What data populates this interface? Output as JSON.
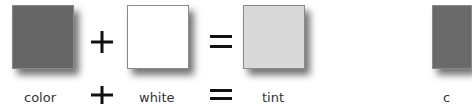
{
  "diagram": {
    "swatches": [
      {
        "id": "color",
        "label": "color",
        "fill": "#666666"
      },
      {
        "id": "white",
        "label": "white",
        "fill": "#ffffff"
      },
      {
        "id": "tint",
        "label": "tint",
        "fill": "#d9d9d9"
      },
      {
        "id": "color-2",
        "label": "c",
        "fill": "#6a6a6a"
      }
    ],
    "operators": {
      "plus": "+",
      "equals": "="
    }
  }
}
